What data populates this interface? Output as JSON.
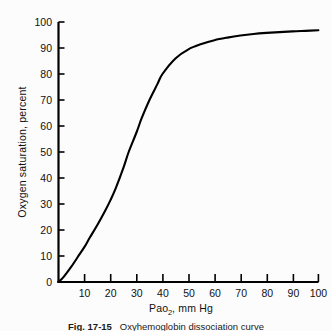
{
  "figure": {
    "background_color": "#fcfcfc",
    "line_color": "#000000",
    "axis_color": "#000000"
  },
  "axis": {
    "y_title": "Oxygen saturation, percent",
    "x_title_main": "Pao",
    "x_title_sub": "2",
    "x_title_rest": ", mm Hg",
    "x_title_full": "Pao2, mm Hg",
    "y_ticks": [
      "0",
      "10",
      "20",
      "30",
      "40",
      "50",
      "60",
      "70",
      "80",
      "90",
      "100"
    ],
    "x_ticks": [
      "10",
      "20",
      "30",
      "40",
      "50",
      "60",
      "70",
      "80",
      "90",
      "100"
    ]
  },
  "caption": {
    "figure_number": "Fig. 17-15",
    "text": "Oxyhemoglobin dissociation curve"
  },
  "chart_data": {
    "type": "line",
    "title": "",
    "xlabel": "Pao2, mm Hg",
    "ylabel": "Oxygen saturation, percent",
    "xlim": [
      0,
      100
    ],
    "ylim": [
      0,
      100
    ],
    "xticks": [
      0,
      10,
      20,
      30,
      40,
      50,
      60,
      70,
      80,
      90,
      100
    ],
    "yticks": [
      0,
      10,
      20,
      30,
      40,
      50,
      60,
      70,
      80,
      90,
      100
    ],
    "grid": false,
    "legend": false,
    "series": [
      {
        "name": "Oxyhemoglobin dissociation curve",
        "x": [
          0,
          2,
          5,
          8,
          10,
          12,
          15,
          18,
          20,
          22,
          25,
          27,
          30,
          32,
          35,
          38,
          40,
          45,
          50,
          55,
          60,
          65,
          70,
          75,
          80,
          85,
          90,
          95,
          100
        ],
        "y": [
          0,
          2,
          6,
          10.5,
          13.5,
          17,
          22,
          27.5,
          31.5,
          36,
          44,
          50,
          57.5,
          63,
          70,
          76,
          80,
          86,
          89.5,
          91.5,
          93,
          94,
          94.8,
          95.4,
          95.8,
          96.1,
          96.4,
          96.6,
          96.8
        ]
      }
    ]
  }
}
